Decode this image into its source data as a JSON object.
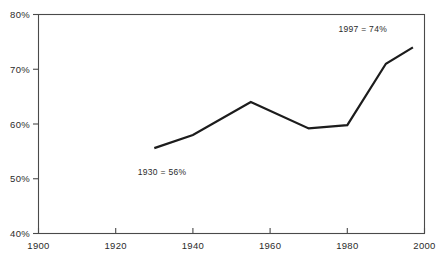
{
  "chart_data": {
    "type": "line",
    "title": "",
    "subtitle": "",
    "xlabel": "",
    "ylabel": "",
    "xlim": [
      1900,
      2000
    ],
    "ylim": [
      40,
      80
    ],
    "grid": false,
    "legend": "none",
    "x_ticks": [
      1900,
      1920,
      1940,
      1960,
      1980,
      2000
    ],
    "x_tick_labels": [
      "1900",
      "1920",
      "1940",
      "1960",
      "1980",
      "2000"
    ],
    "y_ticks": [
      40,
      50,
      60,
      70,
      80
    ],
    "y_tick_labels": [
      "40%",
      "50%",
      "60%",
      "70%",
      "80%"
    ],
    "series": [
      {
        "name": "percent",
        "x": [
          1930,
          1940,
          1955,
          1970,
          1980,
          1990,
          1997
        ],
        "values": [
          55.6,
          58.0,
          64.0,
          59.2,
          59.8,
          71.0,
          74.0
        ]
      }
    ],
    "annotations": [
      {
        "name": "start-annotation",
        "text": "1930  =  56%",
        "x": 1932,
        "y": 50.6
      },
      {
        "name": "end-annotation",
        "text": "1997  =  74%",
        "x": 1984,
        "y": 76.8
      }
    ],
    "colors": {
      "line": "#1c1c1c",
      "frame": "#4a4a4a",
      "text": "#2b2b2b",
      "background": "#ffffff"
    }
  }
}
